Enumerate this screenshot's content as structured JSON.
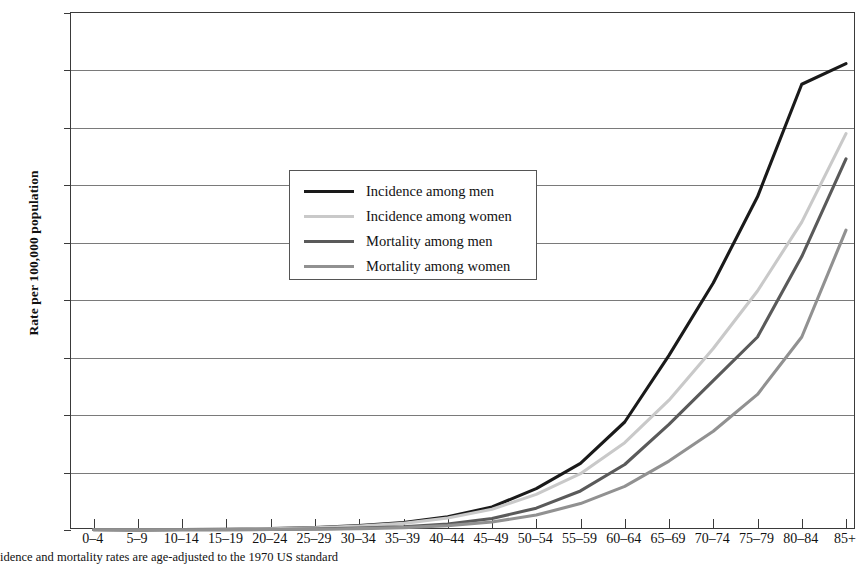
{
  "chart_data": {
    "type": "line",
    "title": "",
    "xlabel": "",
    "ylabel": "Rate per 100,000 population",
    "ylim": [
      0,
      450
    ],
    "ytick_step": 50,
    "yticks": [
      0,
      50,
      100,
      150,
      200,
      250,
      300,
      350,
      400,
      450
    ],
    "grid": true,
    "legend_position": "upper-left-inside",
    "categories": [
      "0–4",
      "5–9",
      "10–14",
      "15–19",
      "20–24",
      "25–29",
      "30–34",
      "35–39",
      "40–44",
      "45–49",
      "50–54",
      "55–59",
      "60–64",
      "65–69",
      "70–74",
      "75–79",
      "80–84",
      "85+"
    ],
    "series": [
      {
        "name": "Incidence among men",
        "color": "#1a1a1a",
        "width": 3.1,
        "values": [
          0.4,
          0.3,
          0.4,
          0.7,
          1.2,
          2.2,
          3.8,
          6.5,
          11.5,
          20.0,
          36.0,
          58.0,
          94.0,
          152.0,
          215.0,
          290.0,
          388.0,
          406.0
        ]
      },
      {
        "name": "Incidence among women",
        "color": "#c9c9c9",
        "width": 3.1,
        "values": [
          0.4,
          0.3,
          0.4,
          0.7,
          1.1,
          2.0,
          3.4,
          5.8,
          10.5,
          18.0,
          31.0,
          49.0,
          76.0,
          113.0,
          158.0,
          208.0,
          268.0,
          345.0
        ]
      },
      {
        "name": "Mortality among men",
        "color": "#5a5a5a",
        "width": 3.1,
        "values": [
          0.2,
          0.1,
          0.2,
          0.3,
          0.5,
          0.9,
          1.6,
          2.8,
          5.2,
          10.0,
          19.0,
          34.0,
          57.0,
          92.0,
          130.0,
          168.0,
          238.0,
          323.0
        ]
      },
      {
        "name": "Mortality among women",
        "color": "#919191",
        "width": 3.1,
        "values": [
          0.2,
          0.1,
          0.2,
          0.3,
          0.4,
          0.7,
          1.2,
          2.1,
          3.8,
          7.0,
          13.0,
          23.0,
          38.0,
          60.0,
          86.0,
          118.0,
          168.0,
          261.0
        ]
      }
    ],
    "footnote": "idence and mortality rates are age-adjusted to the 1970 US standard"
  }
}
